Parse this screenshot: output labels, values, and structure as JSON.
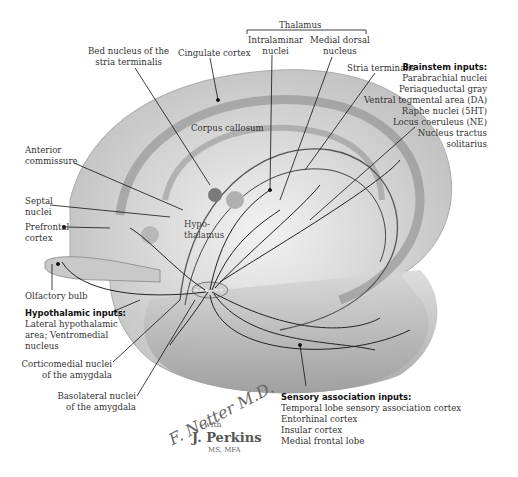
{
  "figure": {
    "structures": {
      "thalamus": "Thalamus",
      "intralaminar_nuclei": [
        "Intralaminar",
        "nuclei"
      ],
      "medial_dorsal_nucleus": [
        "Medial dorsal",
        "nucleus"
      ],
      "bed_nucleus": [
        "Bed nucleus of the",
        "stria terminalis"
      ],
      "cingulate_cortex": "Cingulate cortex",
      "stria_terminalis": "Stria terminalis",
      "corpus_callosum": "Corpus callosum",
      "anterior_commissure": [
        "Anterior",
        "commissure"
      ],
      "septal_nuclei": [
        "Septal",
        "nuclei"
      ],
      "prefrontal_cortex": [
        "Prefrontal",
        "cortex"
      ],
      "hypothalamus": [
        "Hypo-",
        "thalamus"
      ],
      "olfactory_bulb": "Olfactory bulb",
      "corticomedial_nuclei": [
        "Corticomedial nuclei",
        "of the amygdala"
      ],
      "basolateral_nuclei": [
        "Basolateral nuclei",
        "of the amygdala"
      ]
    },
    "brainstem_inputs": {
      "heading": "Brainstem inputs:",
      "items": [
        "Parabrachial nuclei",
        "Periaqueductal gray",
        "Ventral tegmental area (DA)",
        "Raphe nuclei (5HT)",
        "Locus coeruleus (NE)",
        "Nucleus tractus",
        "solitarius"
      ]
    },
    "hypothalamic_inputs": {
      "heading": "Hypothalamic inputs:",
      "items": [
        "Lateral hypothalamic",
        "area; Ventromedial",
        "nucleus"
      ]
    },
    "sensory_association_inputs": {
      "heading": "Sensory association inputs:",
      "items": [
        "Temporal lobe sensory association cortex",
        "Entorhinal cortex",
        "Insular cortex",
        "Medial frontal lobe"
      ]
    },
    "signature": {
      "artist": "F. Netter M.D.",
      "with": "with",
      "coauthor": "J. Perkins",
      "credentials": "MS, MFA"
    }
  }
}
